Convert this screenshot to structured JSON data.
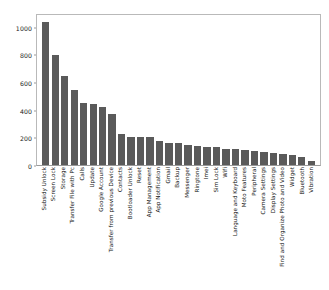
{
  "chart_data": {
    "type": "bar",
    "title": "",
    "xlabel": "",
    "ylabel": "",
    "ylim": [
      0,
      1100
    ],
    "yticks": [
      0,
      200,
      400,
      600,
      800,
      1000
    ],
    "ytick_labels": [
      "0",
      "200",
      "400",
      "600",
      "800",
      "1000"
    ],
    "grid": false,
    "legend": null,
    "bar_color": "#5a5a5a",
    "categories": [
      "Subsidy Unlock",
      "Screen Lock",
      "Storage",
      "Transfer File with Pc",
      "Calls",
      "Update",
      "Google Account",
      "Transfer from previous Device",
      "Contacts",
      "Bootloader Unlock",
      "Reset",
      "App Management",
      "App Notification",
      "Gmail",
      "Backup",
      "Messenger",
      "Ringtone",
      "Imei",
      "Sim Lock",
      "Wifi",
      "Language and Keyboard",
      "Moto Features",
      "Peripheral",
      "Camera Settings",
      "Display Settings",
      "Find and Organize Photo and Video",
      "Widget",
      "Bluetooth",
      "Vibration"
    ],
    "values": [
      1050,
      810,
      655,
      550,
      455,
      450,
      425,
      375,
      230,
      205,
      205,
      205,
      175,
      165,
      160,
      150,
      140,
      135,
      130,
      120,
      115,
      110,
      100,
      95,
      90,
      80,
      70,
      60,
      30
    ]
  }
}
